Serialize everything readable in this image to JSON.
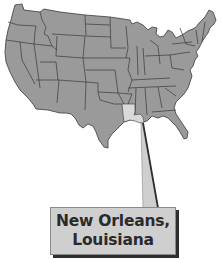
{
  "map": {
    "region": "Contiguous United States",
    "highlighted_state": "Louisiana",
    "colors": {
      "state_fill": "#9a9a9a",
      "state_border": "#3a3a3a",
      "highlight_fill": "#d9d9d9",
      "callout_fill": "#cfcfcf",
      "callout_shadow": "#2e2e2e",
      "text": "#2a2a2a"
    }
  },
  "callout": {
    "line1": "New Orleans,",
    "line2": "Louisiana"
  }
}
